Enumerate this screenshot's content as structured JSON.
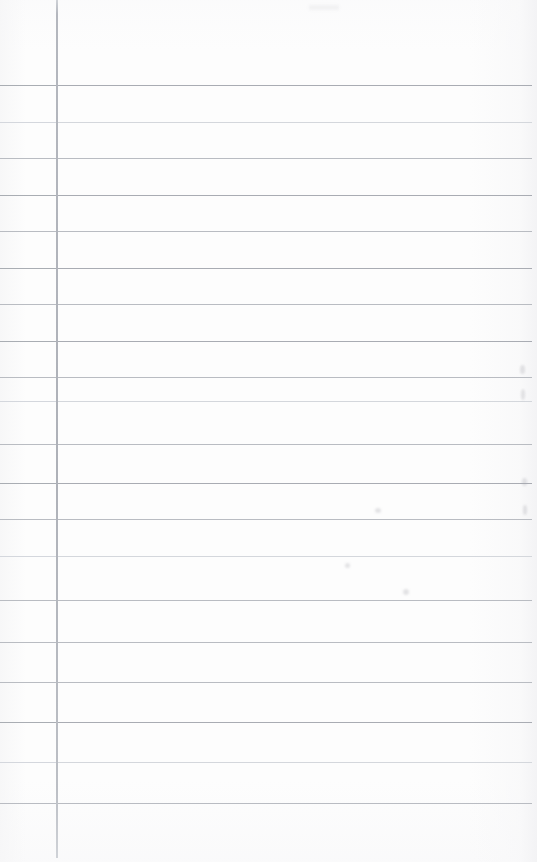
{
  "page": {
    "kind": "blank-ruled-notebook-page",
    "width": 537,
    "height": 862,
    "background_color": "#fdfdfd",
    "text_content": ""
  },
  "margin_rule": {
    "label": "vertical-margin-line",
    "x": 56,
    "top": 0,
    "bottom": 858,
    "width_px": 2,
    "color": "#b0b3ba"
  },
  "ruling": {
    "label": "horizontal-ruled-lines",
    "first_line_y": 85,
    "spacing_px": 36.6,
    "line_start_x": 0,
    "line_end_x": 532,
    "count": 20,
    "base_color": "#b9bcc2",
    "faint_color": "#d4d7dc",
    "strong_color": "#a9acb3",
    "lines": [
      {
        "y": 85,
        "weight": "strong"
      },
      {
        "y": 122,
        "weight": "faint"
      },
      {
        "y": 158,
        "weight": "normal"
      },
      {
        "y": 195,
        "weight": "strong"
      },
      {
        "y": 231,
        "weight": "normal"
      },
      {
        "y": 268,
        "weight": "strong"
      },
      {
        "y": 304,
        "weight": "normal"
      },
      {
        "y": 341,
        "weight": "strong"
      },
      {
        "y": 377,
        "weight": "normal"
      },
      {
        "y": 401,
        "weight": "faint"
      },
      {
        "y": 444,
        "weight": "normal"
      },
      {
        "y": 483,
        "weight": "strong"
      },
      {
        "y": 519,
        "weight": "normal"
      },
      {
        "y": 556,
        "weight": "faint"
      },
      {
        "y": 600,
        "weight": "normal"
      },
      {
        "y": 642,
        "weight": "normal"
      },
      {
        "y": 682,
        "weight": "normal"
      },
      {
        "y": 722,
        "weight": "strong"
      },
      {
        "y": 762,
        "weight": "faint"
      },
      {
        "y": 803,
        "weight": "normal"
      }
    ]
  },
  "artifacts": {
    "label": "scan-smudges",
    "marks": [
      {
        "x": 520,
        "y": 365,
        "w": 5,
        "h": 9
      },
      {
        "x": 521,
        "y": 389,
        "w": 4,
        "h": 11
      },
      {
        "x": 522,
        "y": 478,
        "w": 5,
        "h": 8
      },
      {
        "x": 523,
        "y": 505,
        "w": 4,
        "h": 10
      },
      {
        "x": 375,
        "y": 508,
        "w": 6,
        "h": 5
      },
      {
        "x": 345,
        "y": 563,
        "w": 5,
        "h": 5
      },
      {
        "x": 403,
        "y": 589,
        "w": 6,
        "h": 6
      },
      {
        "x": 309,
        "y": 5,
        "w": 30,
        "h": 5
      }
    ]
  }
}
